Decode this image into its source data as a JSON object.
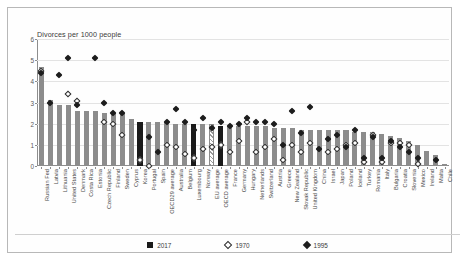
{
  "chart_data": {
    "type": "bar",
    "title": "Divorces per 1000 people",
    "xlabel": "",
    "ylabel": "",
    "ylim": [
      0,
      6
    ],
    "yticks": [
      0,
      1,
      2,
      3,
      4,
      5,
      6
    ],
    "grid": true,
    "legend_position": "bottom",
    "categories": [
      "Russian Fed",
      "Latvia",
      "Lithuania",
      "United States",
      "Denmark",
      "Costa Rica",
      "Estonia",
      "Czech Republic",
      "Finland",
      "Sweden",
      "Cyprus",
      "Korea",
      "Portugal",
      "Spain",
      "OECD29 average",
      "Australia",
      "Belgium",
      "Luxembourg",
      "Norway",
      "EU average",
      "OECD average",
      "France",
      "Germany",
      "Hungary",
      "Netherlands",
      "Switzerland",
      "Austria",
      "Greece",
      "New Zealand",
      "Slovak Republic",
      "United Kingdom",
      "China",
      "Israel",
      "Japan",
      "Poland",
      "Iceland",
      "Turkey",
      "Romania",
      "Italy",
      "Bulgaria",
      "Croatia",
      "Slovenia",
      "Mexico",
      "Ireland",
      "Malta",
      "Chile"
    ],
    "series": [
      {
        "name": "2017",
        "marker": "filled-square",
        "type": "bar",
        "values": [
          4.7,
          3.1,
          2.9,
          2.9,
          2.6,
          2.6,
          2.6,
          2.5,
          2.5,
          2.5,
          2.2,
          2.1,
          2.1,
          2.1,
          2.1,
          2.0,
          2.0,
          2.0,
          2.0,
          2.0,
          1.9,
          1.9,
          1.9,
          1.9,
          1.9,
          1.9,
          1.8,
          1.8,
          1.8,
          1.7,
          1.7,
          1.7,
          1.7,
          1.7,
          1.7,
          1.6,
          1.6,
          1.6,
          1.5,
          1.4,
          1.3,
          1.2,
          1.0,
          0.7,
          0.5,
          0.1
        ]
      },
      {
        "name": "1970",
        "marker": "open-diamond",
        "type": "scatter",
        "values": [
          4.6,
          null,
          null,
          3.5,
          3.2,
          null,
          null,
          2.2,
          2.1,
          1.6,
          null,
          0.4,
          0.1,
          null,
          1.1,
          1.0,
          0.7,
          0.5,
          0.9,
          1.0,
          1.1,
          0.8,
          1.3,
          2.2,
          0.8,
          1.0,
          1.4,
          0.4,
          1.1,
          0.8,
          1.2,
          null,
          0.8,
          0.9,
          1.1,
          1.2,
          0.3,
          1.6,
          0.3,
          1.2,
          1.2,
          1.1,
          0.2,
          null,
          null,
          null
        ]
      },
      {
        "name": "1995",
        "marker": "filled-diamond",
        "type": "scatter",
        "values": [
          4.5,
          3.1,
          4.4,
          5.2,
          3.0,
          null,
          5.2,
          3.1,
          2.6,
          2.6,
          null,
          1.5,
          1.5,
          0.8,
          2.2,
          2.8,
          2.2,
          1.8,
          2.4,
          1.9,
          2.2,
          2.0,
          2.1,
          2.4,
          2.2,
          2.2,
          2.1,
          1.1,
          2.7,
          1.7,
          2.9,
          0.9,
          1.4,
          1.6,
          1.0,
          1.8,
          0.5,
          1.5,
          0.5,
          1.3,
          1.0,
          0.8,
          0.5,
          null,
          0.4,
          null
        ]
      }
    ]
  },
  "legend": {
    "items": [
      {
        "label": "2017",
        "symbol": "filled-square"
      },
      {
        "label": "1970",
        "symbol": "open-diamond"
      },
      {
        "label": "1995",
        "symbol": "filled-diamond"
      }
    ]
  },
  "style": {
    "bar_color": "#8c8c8c",
    "bar_color_dark": "#1a1a1a",
    "marker_color": "#1d1d1d",
    "grid_color": "#e3e3e3",
    "axis_color": "#8d8d8d",
    "text_color": "#3a3a3a"
  },
  "highlight": {
    "dark_bars": [
      "Korea",
      "Luxembourg",
      "OECD average"
    ],
    "hatched_bars": [
      "EU average"
    ]
  }
}
